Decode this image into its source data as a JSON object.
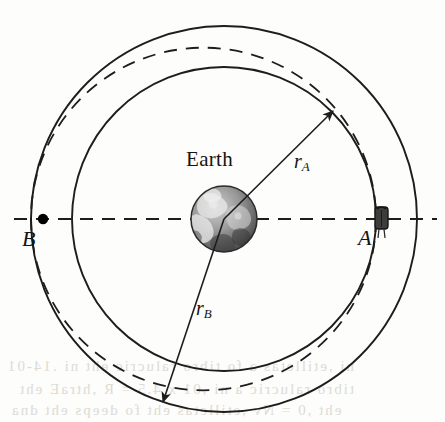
{
  "figure": {
    "center_body_label": "Earth",
    "labels": {
      "point_a": "A",
      "point_b": "B",
      "radius_a_base": "r",
      "radius_a_sub": "A",
      "radius_b_base": "r",
      "radius_b_sub": "B"
    },
    "colors": {
      "background": "#fdfdfb",
      "stroke": "#1d1d1d",
      "dash_stroke": "#1d1d1d",
      "point_fill": "#000000",
      "earth_dark": "#3a3a3a",
      "earth_mid": "#8e8e8e",
      "earth_light": "#e6e6e6",
      "bleed_text": "#d8d6d0"
    },
    "geometry": {
      "center_x": 224,
      "center_y": 219,
      "outer_orbit_radius": 193,
      "inner_orbit_radius": 152,
      "earth_radius": 33,
      "point_a_x": 381,
      "point_a_y": 219,
      "point_b_x": 43,
      "point_b_y": 219,
      "radius_a_angle_deg": -45,
      "radius_b_angle_deg": 125
    },
    "elements": {
      "outer_orbit": "outer circular orbit (solid)",
      "inner_orbit": "inner circular orbit (solid)",
      "transfer_ellipse": "dashed transfer ellipse from A to B",
      "axis": "dashed horizontal apse line through Earth",
      "radius_a_arrow": "arrow from Earth center to inner orbit",
      "radius_b_arrow": "arrow from Earth center to outer orbit",
      "satellite": "satellite at point A"
    }
  },
  "bleed_lines": [
    "ni ,etilletas a fo tibro ralucric eht ni .14-01",
    "tibro ralucric a ni ,01 x 4.5 = R ,htraE eht",
    "eht ,0 = Nv ,etilletas eht fo deeps eht dna"
  ]
}
